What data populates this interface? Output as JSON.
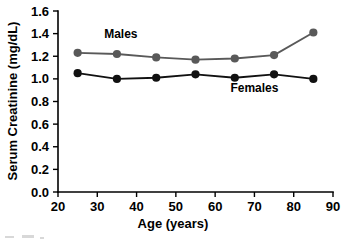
{
  "chart_data": {
    "type": "line",
    "title": "",
    "xlabel": "Age (years)",
    "ylabel": "Serum Creatinine (mg/dL)",
    "xlim": [
      20,
      90
    ],
    "ylim": [
      0.0,
      1.6
    ],
    "xticks": [
      20,
      30,
      40,
      50,
      60,
      70,
      80,
      90
    ],
    "xtick_labels": [
      "20",
      "30",
      "40",
      "50",
      "60",
      "70",
      "80",
      "90"
    ],
    "yticks": [
      0.0,
      0.2,
      0.4,
      0.6,
      0.8,
      1.0,
      1.2,
      1.4,
      1.6
    ],
    "ytick_labels": [
      "0.0",
      "0.2",
      "0.4",
      "0.6",
      "0.8",
      "1.0",
      "1.2",
      "1.4",
      "1.6"
    ],
    "grid": false,
    "legend_position": "inline-annotations",
    "x": [
      25,
      35,
      45,
      55,
      65,
      75,
      85
    ],
    "series": [
      {
        "name": "Males",
        "color": "#595959",
        "marker": "circle",
        "values": [
          1.23,
          1.22,
          1.19,
          1.17,
          1.18,
          1.21,
          1.41
        ]
      },
      {
        "name": "Females",
        "color": "#111111",
        "marker": "circle",
        "values": [
          1.05,
          1.0,
          1.01,
          1.04,
          1.01,
          1.04,
          1.0
        ]
      }
    ],
    "annotations": [
      {
        "text": "Males",
        "x": 36,
        "y": 1.36
      },
      {
        "text": "Females",
        "x": 70,
        "y": 0.88
      }
    ]
  }
}
